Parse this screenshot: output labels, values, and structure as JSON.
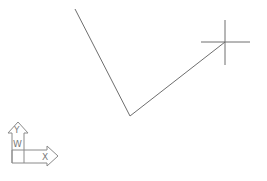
{
  "viewport": {
    "background": "#ffffff",
    "line_color": "#6e6e6e"
  },
  "drawing": {
    "polyline": {
      "points": [
        [
          75,
          9
        ],
        [
          130,
          116
        ],
        [
          225,
          42
        ]
      ]
    },
    "crosshair": {
      "center": [
        225,
        42
      ],
      "h_extent": [
        201,
        250
      ],
      "v_extent": [
        20,
        65
      ]
    }
  },
  "ucs_icon": {
    "y_label": "Y",
    "w_label": "W",
    "x_label": "X"
  }
}
